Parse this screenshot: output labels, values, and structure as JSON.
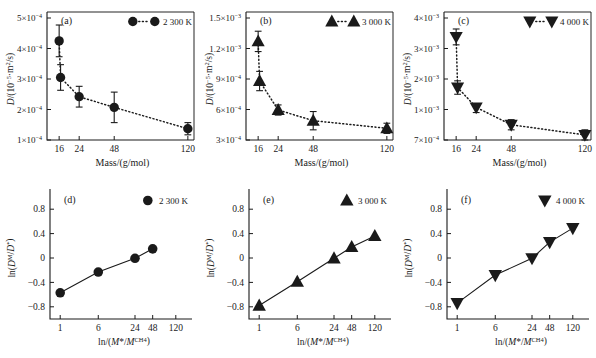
{
  "figure": {
    "background": "#ffffff",
    "ink": "#1a1a1a",
    "panels": [
      "a",
      "b",
      "c",
      "d",
      "e",
      "f"
    ]
  },
  "labels": {
    "panel_a": "(a)",
    "panel_b": "(b)",
    "panel_c": "(c)",
    "panel_d": "(d)",
    "panel_e": "(e)",
    "panel_f": "(f)",
    "legend_2300": "2 300 K",
    "legend_3000": "3 000 K",
    "legend_4000": "4 000 K",
    "xlabel_top": "Mass/(g/mol)",
    "ylabel_top_prefix": "D",
    "ylabel_top_rest": "/(10",
    "ylabel_top_exp": "−5",
    "ylabel_top_tail": "·m²/s)",
    "ylabel_bottom": "ln(D",
    "ylabel_bottom_sup1": "M",
    "ylabel_bottom_mid": "/D",
    "ylabel_bottom_sup2": "*",
    "ylabel_bottom_end": ")",
    "xlabel_bottom": "ln/(M*/M",
    "xlabel_bottom_sup": "CH4",
    "xlabel_bottom_end": ")"
  },
  "chart_data": [
    {
      "id": "a",
      "type": "scatter",
      "panel_label": "(a)",
      "title": "",
      "xlabel": "Mass/(g/mol)",
      "ylabel": "D/(10−5·m²/s)",
      "legend": [
        "2 300 K"
      ],
      "legend_position": "top-right",
      "marker": "circle",
      "connector": "dotted",
      "grid": false,
      "xscale": "log-like-ordinal",
      "xticks": [
        16,
        24,
        48,
        120
      ],
      "xticklabels": [
        "16",
        "24",
        "48",
        "120"
      ],
      "yticks": [
        0.0001,
        0.0002,
        0.0003,
        0.0004,
        0.0005
      ],
      "yticklabels": [
        "1×10−4",
        "2×10−4",
        "3×10−4",
        "4×10−4",
        "5×10−4"
      ],
      "ylim": [
        7e-05,
        0.00055
      ],
      "x": [
        16,
        18,
        24,
        48,
        120
      ],
      "y": [
        0.000425,
        0.000305,
        0.000242,
        0.000207,
        0.000137
      ],
      "yerr": [
        5.2e-05,
        4.2e-05,
        3.4e-05,
        5e-05,
        2e-05
      ]
    },
    {
      "id": "b",
      "type": "scatter",
      "panel_label": "(b)",
      "title": "",
      "xlabel": "Mass/(g/mol)",
      "ylabel": "D/(10−5·m²/s)",
      "legend": [
        "3 000 K"
      ],
      "legend_position": "top-right",
      "marker": "triangle-up",
      "connector": "dotted",
      "grid": false,
      "xticks": [
        16,
        24,
        48,
        120
      ],
      "xticklabels": [
        "16",
        "24",
        "48",
        "120"
      ],
      "yticks": [
        0.0003,
        0.0006,
        0.0009,
        0.0012,
        0.0015
      ],
      "yticklabels": [
        "3×10−4",
        "6×10−4",
        "9×10−4",
        "1.2×10−3",
        "1.5×10−3"
      ],
      "ylim": [
        0.00022,
        0.00162
      ],
      "x": [
        16,
        18,
        24,
        48,
        120
      ],
      "y": [
        0.00127,
        0.00088,
        0.000595,
        0.00049,
        0.000415
      ],
      "yerr": [
        0.0001,
        9.5e-05,
        5e-05,
        9e-05,
        5e-05
      ]
    },
    {
      "id": "c",
      "type": "scatter",
      "panel_label": "(c)",
      "title": "",
      "xlabel": "Mass/(g/mol)",
      "ylabel": "D/(10−5·m²/s)",
      "legend": [
        "4 000 K"
      ],
      "legend_position": "top-right",
      "marker": "triangle-down",
      "connector": "dotted",
      "grid": false,
      "xticks": [
        16,
        24,
        48,
        120
      ],
      "xticklabels": [
        "16",
        "24",
        "48",
        "120"
      ],
      "yticks": [
        0.0007,
        0.001,
        0.002,
        0.003,
        0.004
      ],
      "yticklabels": [
        "7×10−4",
        "1×10−3",
        "2×10−3",
        "3×10−3",
        "4×10−3"
      ],
      "ylim": [
        0.0006,
        0.0043
      ],
      "x": [
        16,
        18,
        24,
        48,
        120
      ],
      "y": [
        0.00338,
        0.00172,
        0.00107,
        0.00085,
        0.00075
      ],
      "yerr": [
        0.00026,
        0.00022,
        0.0001,
        5e-05,
        5e-05
      ]
    },
    {
      "id": "d",
      "type": "scatter",
      "panel_label": "(d)",
      "title": "",
      "xlabel": "ln/(M*/M^CH4)",
      "ylabel": "ln(D^M/D^*)",
      "legend": [
        "2 300 K"
      ],
      "legend_position": "top-right",
      "marker": "circle",
      "connector": "solid",
      "grid": false,
      "xticks": [
        1,
        6,
        24,
        48,
        120
      ],
      "xticklabels": [
        "1",
        "6",
        "24",
        "48",
        "120"
      ],
      "yticks": [
        -0.8,
        -0.4,
        0,
        0.4,
        0.8
      ],
      "yticklabels": [
        "−0.8",
        "−0.4",
        "0",
        "0.4",
        "0.8"
      ],
      "ylim": [
        -1.0,
        1.0
      ],
      "x": [
        1,
        6,
        24,
        48
      ],
      "y": [
        -0.57,
        -0.23,
        -0.005,
        0.15
      ]
    },
    {
      "id": "e",
      "type": "scatter",
      "panel_label": "(e)",
      "title": "",
      "xlabel": "ln/(M*/M^CH4)",
      "ylabel": "ln(D^M/D^*)",
      "legend": [
        "3 000 K"
      ],
      "legend_position": "top-right",
      "marker": "triangle-up",
      "connector": "solid",
      "grid": false,
      "xticks": [
        1,
        6,
        24,
        48,
        120
      ],
      "xticklabels": [
        "1",
        "6",
        "24",
        "48",
        "120"
      ],
      "yticks": [
        -0.8,
        -0.4,
        0,
        0.4,
        0.8
      ],
      "yticklabels": [
        "−0.8",
        "−0.4",
        "0",
        "0.4",
        "0.8"
      ],
      "ylim": [
        -1.0,
        1.0
      ],
      "x": [
        1,
        6,
        24,
        48,
        120
      ],
      "y": [
        -0.78,
        -0.39,
        -0.005,
        0.18,
        0.36
      ]
    },
    {
      "id": "f",
      "type": "scatter",
      "panel_label": "(f)",
      "title": "",
      "xlabel": "ln/(M*/M^CH4)",
      "ylabel": "ln(D^M/D^*)",
      "legend": [
        "4 000 K"
      ],
      "legend_position": "top-right",
      "marker": "triangle-down",
      "connector": "solid",
      "grid": false,
      "xticks": [
        1,
        6,
        24,
        48,
        120
      ],
      "xticklabels": [
        "1",
        "6",
        "24",
        "48",
        "120"
      ],
      "yticks": [
        -0.8,
        -0.4,
        0,
        0.4,
        0.8
      ],
      "yticklabels": [
        "−0.8",
        "−0.4",
        "0",
        "0.4",
        "0.8"
      ],
      "ylim": [
        -1.0,
        1.0
      ],
      "x": [
        1,
        6,
        24,
        48,
        120
      ],
      "y": [
        -0.74,
        -0.28,
        -0.005,
        0.26,
        0.49
      ]
    }
  ]
}
